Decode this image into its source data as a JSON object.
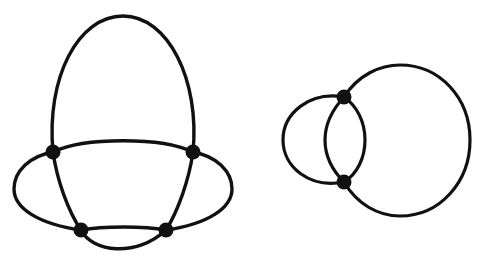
{
  "figure": {
    "background_color": "#ffffff",
    "stroke_color": "#111111",
    "vertex_color": "#111111",
    "width": 493,
    "height": 277
  },
  "chart_data": {
    "type": "diagram",
    "xlabel": "",
    "ylabel": "",
    "grid": false,
    "legend": "none",
    "xlim": [
      0,
      493
    ],
    "ylim": [
      0,
      277
    ],
    "graphs": [
      {
        "name": "left-graph",
        "description": "Four-vertex planar embedding with five curved edges forming nested faces",
        "vertex_count": 4,
        "edge_count": 6,
        "vertices": [
          {
            "id": "L1",
            "label": "top-left",
            "x": 53,
            "y": 152,
            "radius": 7
          },
          {
            "id": "L2",
            "label": "top-right",
            "x": 193,
            "y": 152,
            "radius": 7
          },
          {
            "id": "L3",
            "label": "bottom-left",
            "x": 81,
            "y": 230,
            "radius": 7
          },
          {
            "id": "L4",
            "label": "bottom-right",
            "x": 166,
            "y": 230,
            "radius": 7
          }
        ],
        "edges": [
          {
            "id": "L-e1",
            "from": "L1",
            "to": "L2",
            "shape": "tall-arch-over-top",
            "apex_y": 16
          },
          {
            "id": "L-e2",
            "from": "L1",
            "to": "L2",
            "shape": "shallow-arc-upward",
            "apex_y": 139
          },
          {
            "id": "L-e3",
            "from": "L1",
            "to": "L3",
            "shape": "ellipse-left-side",
            "extreme_x": 14
          },
          {
            "id": "L-e4",
            "from": "L2",
            "to": "L4",
            "shape": "ellipse-right-side",
            "extreme_x": 232
          },
          {
            "id": "L-e5",
            "from": "L3",
            "to": "L4",
            "shape": "near-straight-chord",
            "apex_y": 228
          },
          {
            "id": "L-e6",
            "from": "L3",
            "to": "L4",
            "shape": "dip-arc-downward",
            "apex_y": 256
          }
        ],
        "ellipse_outer": {
          "cx": 123,
          "cy": 191,
          "rx": 109,
          "ry": 40
        }
      },
      {
        "name": "right-graph",
        "description": "Two intersecting circles meeting at two degree-four vertices",
        "vertex_count": 2,
        "edge_count": 4,
        "vertices": [
          {
            "id": "R1",
            "label": "upper-intersection",
            "x": 344,
            "y": 97,
            "radius": 7
          },
          {
            "id": "R2",
            "label": "lower-intersection",
            "x": 344,
            "y": 182,
            "radius": 7
          }
        ],
        "circles": [
          {
            "id": "small-circle",
            "cx": 320,
            "cy": 140,
            "r": 45
          },
          {
            "id": "large-circle",
            "cx": 397,
            "cy": 140,
            "r": 73
          }
        ],
        "edges": [
          {
            "id": "R-e1",
            "from": "R1",
            "to": "R2",
            "shape": "small-circle-left-arc"
          },
          {
            "id": "R-e2",
            "from": "R1",
            "to": "R2",
            "shape": "small-circle-right-arc"
          },
          {
            "id": "R-e3",
            "from": "R1",
            "to": "R2",
            "shape": "large-circle-left-arc"
          },
          {
            "id": "R-e4",
            "from": "R1",
            "to": "R2",
            "shape": "large-circle-right-arc"
          }
        ]
      }
    ]
  }
}
